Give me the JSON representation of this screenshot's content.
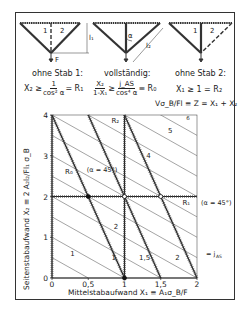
{
  "trusses": [
    {
      "caption": "ohne Stab 1:",
      "bar_labels": [
        "1",
        "2"
      ],
      "dimension": "l₁",
      "load": "F"
    },
    {
      "caption": "vollständig:",
      "angle": "α",
      "dimension": "l₂"
    },
    {
      "caption": "ohne Stab 2:",
      "bar_labels": [
        "1",
        "2"
      ]
    }
  ],
  "conditions": {
    "left": {
      "lhs": "X₂ ≥",
      "num": "1",
      "den": "cos² α",
      "rhs": "= R₁"
    },
    "middle": {
      "num1": "X₂",
      "den1": "1-X₁",
      "ge": "≥",
      "num2": "j_AS",
      "den2": "cos⁴ α",
      "rhs": "≡ R₀"
    },
    "right": {
      "text": "X₁ ≥ 1 = R₂"
    }
  },
  "z_definition": "Vσ_B/Fl ≡ Z = X₁ + X₂",
  "chart_data": {
    "type": "line",
    "title": "",
    "xlabel": "Mittelstabaufwand  X₁ ≡ A₁σ_B/F",
    "ylabel": "Seitenstabaufwand  X₂ ≡ 2 A₂l₂/Fl₁ σ_B",
    "xlim": [
      0,
      2
    ],
    "ylim": [
      0,
      4
    ],
    "xticks": [
      "0",
      "0,5",
      "1",
      "1,5",
      "2"
    ],
    "yticks": [
      "0",
      "1",
      "2",
      "3",
      "4"
    ],
    "grid": false,
    "series": [
      {
        "name": "j_AS = 1",
        "kind": "thick-hatched",
        "points": [
          [
            0,
            4
          ],
          [
            1,
            0
          ]
        ],
        "label": "1"
      },
      {
        "name": "j_AS = 1.5",
        "kind": "thick-hatched",
        "points": [
          [
            0.5,
            4
          ],
          [
            1.5,
            0
          ]
        ],
        "label": "1,5"
      },
      {
        "name": "j_AS = 2",
        "kind": "thick-hatched",
        "points": [
          [
            1,
            4
          ],
          [
            2,
            0
          ]
        ],
        "label": "2"
      },
      {
        "name": "R₁",
        "kind": "boundary-horizontal",
        "points": [
          [
            0,
            2
          ],
          [
            2,
            2
          ]
        ],
        "label": "R₁ (α = 45°)"
      },
      {
        "name": "R₂",
        "kind": "boundary-vertical",
        "points": [
          [
            1,
            0
          ],
          [
            1,
            4
          ]
        ],
        "label": "R₂"
      },
      {
        "name": "Z iso-lines",
        "kind": "thin",
        "values": [
          0.5,
          1,
          1.5,
          2,
          2.5,
          3,
          3.5,
          4,
          4.5,
          5,
          5.5,
          6
        ],
        "labels": {
          "1": "1",
          "2": "2",
          "4": "4",
          "5": "5",
          "6": "6"
        }
      }
    ],
    "points": [
      {
        "x": 0.5,
        "y": 2,
        "style": "filled"
      },
      {
        "x": 1,
        "y": 2,
        "style": "open"
      },
      {
        "x": 1.5,
        "y": 2,
        "style": "open"
      },
      {
        "x": 1,
        "y": 0,
        "style": "filled"
      }
    ],
    "annotations": [
      "R₀",
      "(α = 45°)",
      "R₁",
      "(α = 45°)",
      "R₂",
      "= j_AS"
    ]
  }
}
